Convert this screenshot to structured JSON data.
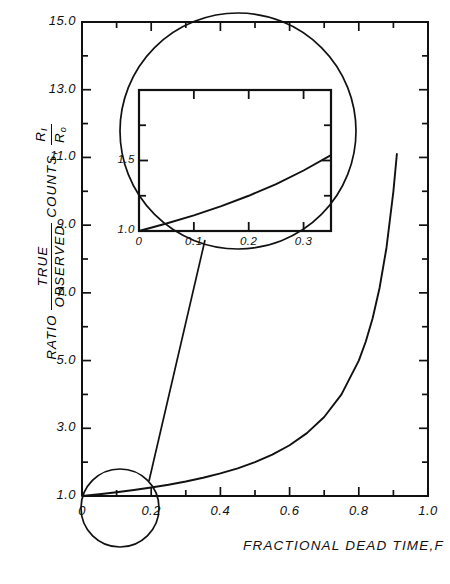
{
  "chart_data": {
    "type": "line",
    "title": "",
    "xlabel": "FRACTIONAL  DEAD  TIME,F",
    "ylabel_prefix": "RATIO",
    "ylabel_num": "TRUE",
    "ylabel_den": "OBSERVED",
    "ylabel_suffix": "COUNTS,",
    "ylabel_sym_num": "R",
    "ylabel_sym_num_sub": "I",
    "ylabel_sym_den": "R",
    "ylabel_sym_den_sub": "o",
    "xlim": [
      0,
      1.0
    ],
    "ylim": [
      1.0,
      15.0
    ],
    "grid": false,
    "legend": "none",
    "xticks": [
      0,
      0.2,
      0.4,
      0.6,
      0.8,
      1.0
    ],
    "xticklabels": [
      "0",
      "0.2",
      "0.4",
      "0.6",
      "0.8",
      "1.0"
    ],
    "xminorticks": [
      0.1,
      0.3,
      0.5,
      0.7,
      0.9
    ],
    "yticks": [
      1.0,
      3.0,
      5.0,
      7.0,
      9.0,
      11.0,
      13.0,
      15.0
    ],
    "yticklabels": [
      "1.0",
      "3.0",
      "5.0",
      "7.0",
      "9.0",
      "11.0",
      "13.0",
      "15.0"
    ],
    "yminorticks": [
      2.0,
      4.0,
      6.0,
      8.0,
      10.0,
      12.0,
      14.0
    ],
    "series": [
      {
        "name": "R_I/R_o = 1/(1-F)",
        "x": [
          0.0,
          0.05,
          0.1,
          0.15,
          0.2,
          0.25,
          0.3,
          0.35,
          0.4,
          0.45,
          0.5,
          0.55,
          0.6,
          0.65,
          0.7,
          0.75,
          0.8,
          0.82,
          0.84,
          0.86,
          0.88,
          0.9,
          0.91
        ],
        "y": [
          1.0,
          1.053,
          1.111,
          1.176,
          1.25,
          1.333,
          1.429,
          1.538,
          1.667,
          1.818,
          2.0,
          2.222,
          2.5,
          2.857,
          3.333,
          4.0,
          5.0,
          5.556,
          6.25,
          7.143,
          8.333,
          10.0,
          11.1
        ]
      }
    ]
  },
  "inset": {
    "type": "line",
    "xlim": [
      0,
      0.35
    ],
    "ylim": [
      1.0,
      2.0
    ],
    "xticks": [
      0,
      0.1,
      0.2,
      0.3
    ],
    "xticklabels": [
      "0",
      "0.1",
      "0.2",
      "0.3"
    ],
    "yticks": [
      1.0,
      1.5
    ],
    "yticklabels": [
      "1.0",
      "1.5"
    ],
    "yminorticks": [
      1.25,
      1.75
    ],
    "series": [
      {
        "name": "R_I/R_o = 1/(1-F)",
        "x": [
          0.0,
          0.05,
          0.1,
          0.15,
          0.2,
          0.25,
          0.3,
          0.35
        ],
        "y": [
          1.0,
          1.053,
          1.111,
          1.176,
          1.25,
          1.333,
          1.429,
          1.538
        ]
      }
    ]
  },
  "annotations": {
    "magnifier_small_label": "detail-circle-origin",
    "magnifier_large_label": "detail-circle-enlarged",
    "connector_label": "magnifier-connector"
  }
}
